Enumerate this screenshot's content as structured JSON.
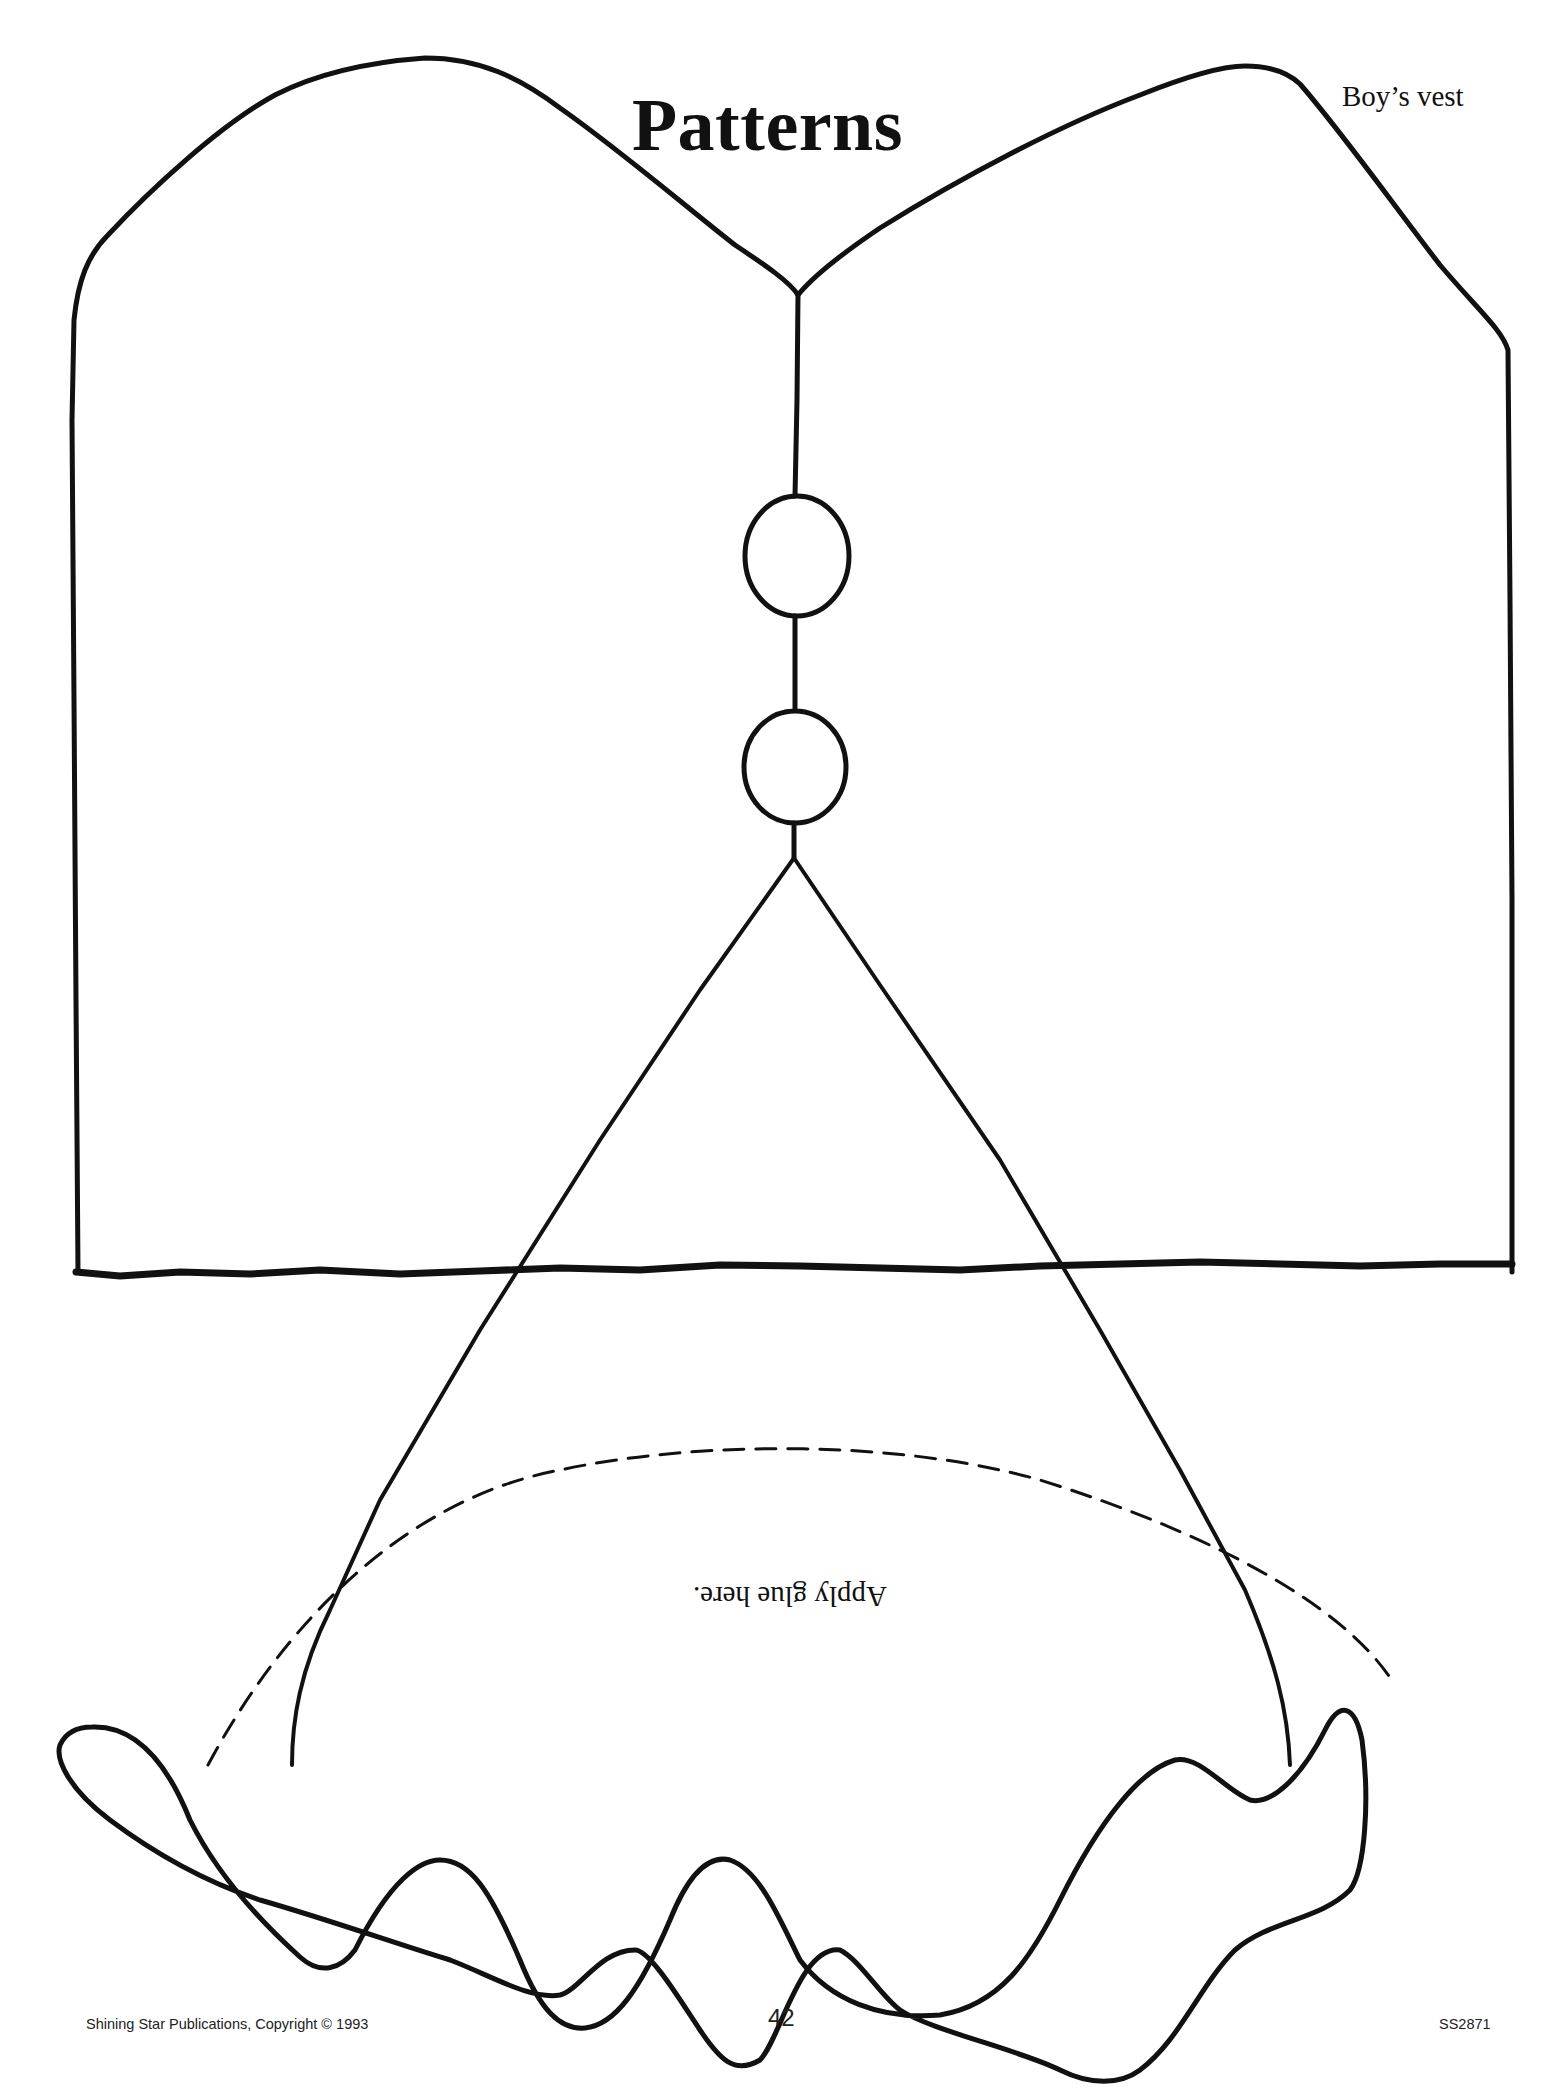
{
  "page": {
    "title": "Patterns",
    "subtitle": "Boy’s vest",
    "instruction": "Apply glue here.",
    "footer": {
      "publisher": "Shining Star Publications, Copyright © 1993",
      "page_number": "42",
      "code": "SS2871"
    }
  },
  "pattern": {
    "pieces": [
      {
        "name": "vest-body",
        "features": [
          "two buttons",
          "center front line",
          "inverted V opening",
          "dashed glue line"
        ]
      },
      {
        "name": "vest-hem-ruffle",
        "features": [
          "wavy scalloped band"
        ]
      }
    ],
    "line_color": "#111111",
    "background_color": "#ffffff"
  }
}
